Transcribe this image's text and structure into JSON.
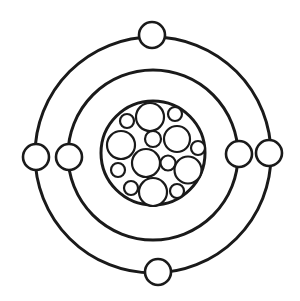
{
  "diagram": {
    "type": "bohr-atom-model",
    "colors": {
      "stroke": "#1a1a1a",
      "fill": "#ffffff",
      "background": "#ffffff"
    },
    "nucleus": {
      "cx": 153,
      "cy": 153,
      "r": 52
    },
    "orbits": [
      {
        "name": "inner-orbit",
        "cx": 153,
        "cy": 155,
        "r": 85
      },
      {
        "name": "outer-orbit",
        "cx": 153,
        "cy": 155,
        "r": 118
      }
    ],
    "electrons": [
      {
        "name": "electron-top",
        "cx": 152,
        "cy": 35,
        "r": 13
      },
      {
        "name": "electron-left-outer",
        "cx": 36,
        "cy": 157,
        "r": 13
      },
      {
        "name": "electron-left-inner",
        "cx": 69,
        "cy": 157,
        "r": 13
      },
      {
        "name": "electron-right-inner",
        "cx": 239,
        "cy": 154,
        "r": 13
      },
      {
        "name": "electron-right-outer",
        "cx": 269,
        "cy": 153,
        "r": 13
      },
      {
        "name": "electron-bottom",
        "cx": 158,
        "cy": 272,
        "r": 13
      }
    ],
    "nucleons": [
      {
        "cx": 150,
        "cy": 117,
        "r": 14
      },
      {
        "cx": 127,
        "cy": 121,
        "r": 7
      },
      {
        "cx": 175,
        "cy": 114,
        "r": 7
      },
      {
        "cx": 121,
        "cy": 145,
        "r": 14
      },
      {
        "cx": 153,
        "cy": 139,
        "r": 8
      },
      {
        "cx": 177,
        "cy": 139,
        "r": 13
      },
      {
        "cx": 198,
        "cy": 148,
        "r": 7
      },
      {
        "cx": 146,
        "cy": 163,
        "r": 14
      },
      {
        "cx": 168,
        "cy": 163,
        "r": 7.5
      },
      {
        "cx": 188,
        "cy": 170,
        "r": 13.5
      },
      {
        "cx": 118,
        "cy": 170,
        "r": 7
      },
      {
        "cx": 131,
        "cy": 188,
        "r": 7
      },
      {
        "cx": 153,
        "cy": 192,
        "r": 14
      },
      {
        "cx": 177,
        "cy": 191,
        "r": 7
      }
    ]
  }
}
